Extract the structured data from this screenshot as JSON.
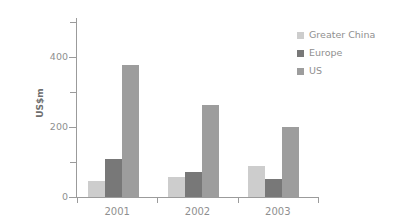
{
  "chart_data": {
    "type": "bar",
    "title": "",
    "subtitle": "",
    "xlabel": "",
    "ylabel": "US$m",
    "categories": [
      "2001",
      "2002",
      "2003"
    ],
    "series": [
      {
        "name": "Greater China",
        "color": "#cdcdcd",
        "values": [
          46,
          57,
          87
        ]
      },
      {
        "name": "Europe",
        "color": "#787878",
        "values": [
          109,
          72,
          52
        ]
      },
      {
        "name": "US",
        "color": "#9d9d9d",
        "values": [
          375,
          263,
          200
        ]
      }
    ],
    "ylim": [
      0,
      510
    ],
    "ytick_values": [
      0,
      100,
      200,
      300,
      400,
      500
    ],
    "ytick_labels": [
      "0",
      "",
      "200",
      "",
      "400",
      ""
    ],
    "grid": false,
    "legend_position": "top-right",
    "annotations": []
  },
  "axis": {
    "y_label": "US$m",
    "y_ticks": [
      {
        "value": 0,
        "label": "0",
        "major": true
      },
      {
        "value": 100,
        "label": "",
        "major": false
      },
      {
        "value": 200,
        "label": "200",
        "major": true
      },
      {
        "value": 300,
        "label": "",
        "major": false
      },
      {
        "value": 400,
        "label": "400",
        "major": true
      },
      {
        "value": 500,
        "label": "",
        "major": false
      }
    ],
    "x_ticks": [
      "2001",
      "2002",
      "2003"
    ]
  },
  "legend": {
    "items": [
      {
        "label": "Greater China",
        "color": "#cdcdcd"
      },
      {
        "label": "Europe",
        "color": "#787878"
      },
      {
        "label": "US",
        "color": "#9d9d9d"
      }
    ]
  }
}
